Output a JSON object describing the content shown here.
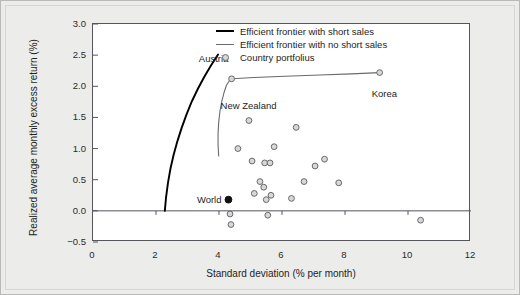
{
  "chart_data": {
    "type": "scatter",
    "title": "",
    "xlabel": "Standard deviation (% per month)",
    "ylabel": "Realized average monthly excess return (%)",
    "xlim": [
      0,
      12
    ],
    "ylim": [
      -0.5,
      3.0
    ],
    "xticks": [
      "0",
      "2",
      "4",
      "6",
      "8",
      "10",
      "12"
    ],
    "xtick_values": [
      0,
      2,
      4,
      6,
      8,
      10,
      12
    ],
    "yticks": [
      "-0.5",
      "0.0",
      "0.5",
      "1.0",
      "1.5",
      "2.0",
      "2.5",
      "3.0"
    ],
    "ytick_values": [
      -0.5,
      0.0,
      0.5,
      1.0,
      1.5,
      2.0,
      2.5,
      3.0
    ],
    "grid": false,
    "zero_line": true,
    "legend_position": "top-center",
    "legend": [
      {
        "key": "line-thick",
        "label": "Efficient frontier with short sales"
      },
      {
        "key": "line-thin",
        "label": "Efficient frontier with no short sales"
      },
      {
        "key": "marker-circle",
        "label": "Country portfolius"
      }
    ],
    "series": [
      {
        "name": "Country portfolius",
        "marker": "open-circle",
        "points": [
          {
            "x": 4.4,
            "y": 2.12,
            "label": "Austria"
          },
          {
            "x": 9.1,
            "y": 2.22,
            "label": "Korea"
          },
          {
            "x": 4.95,
            "y": 1.45,
            "label": ""
          },
          {
            "x": 6.45,
            "y": 1.34,
            "label": ""
          },
          {
            "x": 4.6,
            "y": 1.0,
            "label": ""
          },
          {
            "x": 5.75,
            "y": 1.03,
            "label": ""
          },
          {
            "x": 5.05,
            "y": 0.8,
            "label": ""
          },
          {
            "x": 5.45,
            "y": 0.77,
            "label": ""
          },
          {
            "x": 5.62,
            "y": 0.77,
            "label": ""
          },
          {
            "x": 7.05,
            "y": 0.72,
            "label": ""
          },
          {
            "x": 7.35,
            "y": 0.83,
            "label": ""
          },
          {
            "x": 6.7,
            "y": 0.47,
            "label": ""
          },
          {
            "x": 7.8,
            "y": 0.45,
            "label": ""
          },
          {
            "x": 5.3,
            "y": 0.47,
            "label": ""
          },
          {
            "x": 5.42,
            "y": 0.38,
            "label": ""
          },
          {
            "x": 5.12,
            "y": 0.28,
            "label": ""
          },
          {
            "x": 5.5,
            "y": 0.18,
            "label": ""
          },
          {
            "x": 5.65,
            "y": 0.25,
            "label": ""
          },
          {
            "x": 6.3,
            "y": 0.2,
            "label": ""
          },
          {
            "x": 4.35,
            "y": -0.05,
            "label": ""
          },
          {
            "x": 4.38,
            "y": -0.22,
            "label": ""
          },
          {
            "x": 5.55,
            "y": -0.07,
            "label": ""
          },
          {
            "x": 10.4,
            "y": -0.15,
            "label": ""
          }
        ]
      },
      {
        "name": "World",
        "marker": "filled-circle",
        "points": [
          {
            "x": 4.3,
            "y": 0.18,
            "label": "World"
          }
        ]
      }
    ],
    "curves": [
      {
        "name": "Efficient frontier with short sales",
        "style": "thick",
        "points": [
          [
            2.28,
            0.0
          ],
          [
            2.32,
            0.22
          ],
          [
            2.38,
            0.45
          ],
          [
            2.46,
            0.68
          ],
          [
            2.56,
            0.9
          ],
          [
            2.68,
            1.12
          ],
          [
            2.82,
            1.34
          ],
          [
            2.97,
            1.55
          ],
          [
            3.14,
            1.76
          ],
          [
            3.33,
            1.96
          ],
          [
            3.53,
            2.15
          ],
          [
            3.74,
            2.33
          ],
          [
            3.97,
            2.51
          ]
        ]
      },
      {
        "name": "Efficient frontier with no short sales",
        "style": "thin",
        "points": [
          [
            3.99,
            0.88
          ],
          [
            3.97,
            1.06
          ],
          [
            3.97,
            1.24
          ],
          [
            3.99,
            1.42
          ],
          [
            4.03,
            1.6
          ],
          [
            4.09,
            1.76
          ],
          [
            4.16,
            1.9
          ],
          [
            4.24,
            2.02
          ],
          [
            4.33,
            2.09
          ],
          [
            4.42,
            2.12
          ],
          [
            5.1,
            2.14
          ],
          [
            6.1,
            2.16
          ],
          [
            7.2,
            2.18
          ],
          [
            8.2,
            2.2
          ],
          [
            9.1,
            2.22
          ]
        ]
      }
    ],
    "annotations": [
      {
        "text": "Austria",
        "x": 4.3,
        "y": 2.44,
        "anchor": "end"
      },
      {
        "text": "New Zealand",
        "x": 4.05,
        "y": 1.68,
        "anchor": "start"
      },
      {
        "text": "Korea",
        "x": 9.25,
        "y": 1.88,
        "anchor": "middle"
      },
      {
        "text": "World",
        "x": 4.08,
        "y": 0.18,
        "anchor": "end"
      }
    ],
    "colors": {
      "frontier_short_sales": "#000000",
      "frontier_no_short_sales": "#6a6a6e",
      "marker_edge": "#6a6a6e",
      "marker_fill": "#d8d8d8",
      "world_marker": "#111111",
      "axis": "#55555a",
      "plot_background": "#ffffff",
      "figure_background": "#ececeb"
    }
  }
}
